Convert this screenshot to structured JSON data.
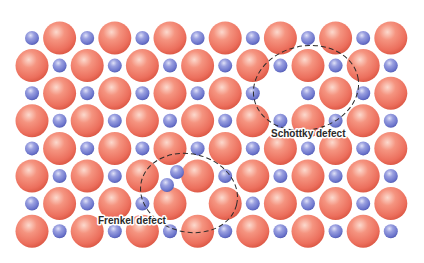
{
  "diagram": {
    "colors": {
      "background": "#ffffff",
      "large_ion": "#ef7a68",
      "large_ion_highlight": "#fbd3c6",
      "large_ion_shadow": "#d9503f",
      "small_ion": "#7d85d6",
      "small_ion_highlight": "#d7daf5",
      "small_ion_shadow": "#4b54ad",
      "outline": "#2b2b2b",
      "label": "#2a2a2a"
    },
    "lattice": {
      "origin_x": 32,
      "origin_y": 38,
      "spacing_x": 27.6,
      "spacing_y": 27.6,
      "columns": 14,
      "rows": 8,
      "large_radius": 16.5,
      "small_radius": 7,
      "rule": "even rows: small at even column, large at odd column; odd rows: large at even column, small at odd column",
      "vacancies": [
        {
          "row": 2,
          "col": 9,
          "type": "large",
          "defect": "schottky"
        },
        {
          "row": 6,
          "col": 6,
          "type": "small",
          "defect": "frenkel"
        }
      ],
      "displaced": [
        {
          "row": 5,
          "col": 5,
          "type": "small",
          "x": 167,
          "y": 185
        },
        {
          "type": "small",
          "x": 177,
          "y": 172,
          "interstitial": true,
          "defect": "frenkel"
        }
      ]
    },
    "defects": [
      {
        "name": "Schottky defect",
        "label": "Schottky defect",
        "outline": {
          "cx": 306,
          "cy": 88,
          "rx": 53,
          "ry": 42,
          "rotate": -12
        },
        "label_pos": {
          "x": 271,
          "y": 137
        }
      },
      {
        "name": "Frenkel defect",
        "label": "Frenkel defect",
        "outline": {
          "cx": 189,
          "cy": 193,
          "rx": 49,
          "ry": 39,
          "rotate": 14
        },
        "label_pos": {
          "x": 98,
          "y": 224
        }
      }
    ]
  }
}
